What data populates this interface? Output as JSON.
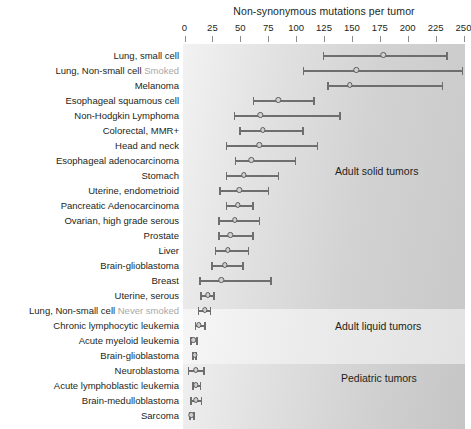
{
  "chart_data": {
    "type": "bar",
    "title": "Non-synonymous mutations per tumor",
    "xlabel": "Non-synonymous mutations per tumor",
    "ylabel": "",
    "xlim": [
      0,
      250
    ],
    "xticks": [
      0,
      25,
      50,
      75,
      100,
      125,
      150,
      175,
      200,
      225,
      250
    ],
    "xticklabels": [
      "0",
      "25",
      "50",
      "75",
      "100",
      "125",
      "150",
      "175",
      "200",
      "225",
      "250"
    ],
    "grid": false,
    "legend": false,
    "orientation": "horizontal",
    "groups": [
      {
        "name": "Adult solid tumors",
        "label": "Adult solid tumors"
      },
      {
        "name": "Adult liquid tumors",
        "label": "Adult liquid tumors"
      },
      {
        "name": "Pediatric tumors",
        "label": "Pediatric tumors"
      }
    ],
    "categories": [
      "Lung, small cell",
      "Lung, Non-small cell Smoked",
      "Melanoma",
      "Esophageal squamous cell",
      "Non-Hodgkin Lymphoma",
      "Colorectal, MMR+",
      "Head and neck",
      "Esophageal adenocarcinoma",
      "Stomach",
      "Uterine, endometrioid",
      "Pancreatic Adenocarcinoma",
      "Ovarian, high grade serous",
      "Prostate",
      "Liver",
      "Brain-glioblastoma",
      "Breast",
      "Uterine, serous",
      "Lung, Non-small cell Never smoked",
      "Chronic lymphocytic leukemia",
      "Acute myeloid leukemia",
      "Brain-glioblastoma",
      "Neuroblastoma",
      "Acute lymphoblastic leukemia",
      "Brain-medulloblastoma",
      "Sarcoma"
    ],
    "rows": [
      {
        "label_main": "Lung, small cell",
        "label_sub": "",
        "group": "Adult solid tumors",
        "low": 124,
        "median": 178,
        "high": 236
      },
      {
        "label_main": "Lung, Non-small cell",
        "label_sub": "Smoked",
        "group": "Adult solid tumors",
        "low": 106,
        "median": 154,
        "high": 250
      },
      {
        "label_main": "Melanoma",
        "label_sub": "",
        "group": "Adult solid tumors",
        "low": 128,
        "median": 148,
        "high": 232
      },
      {
        "label_main": "Esophageal squamous cell",
        "label_sub": "",
        "group": "Adult solid tumors",
        "low": 61,
        "median": 84,
        "high": 117
      },
      {
        "label_main": "Non-Hodgkin Lymphoma",
        "label_sub": "",
        "group": "Adult solid tumors",
        "low": 44,
        "median": 68,
        "high": 140
      },
      {
        "label_main": "Colorectal, MMR+",
        "label_sub": "",
        "group": "Adult solid tumors",
        "low": 49,
        "median": 70,
        "high": 107
      },
      {
        "label_main": "Head and neck",
        "label_sub": "",
        "group": "Adult solid tumors",
        "low": 37,
        "median": 67,
        "high": 120
      },
      {
        "label_main": "Esophageal adenocarcinoma",
        "label_sub": "",
        "group": "Adult solid tumors",
        "low": 45,
        "median": 60,
        "high": 100
      },
      {
        "label_main": "Stomach",
        "label_sub": "",
        "group": "Adult solid tumors",
        "low": 37,
        "median": 53,
        "high": 85
      },
      {
        "label_main": "Uterine, endometrioid",
        "label_sub": "",
        "group": "Adult solid tumors",
        "low": 31,
        "median": 49,
        "high": 76
      },
      {
        "label_main": "Pancreatic Adenocarcinoma",
        "label_sub": "",
        "group": "Adult solid tumors",
        "low": 37,
        "median": 48,
        "high": 62
      },
      {
        "label_main": "Ovarian, high grade serous",
        "label_sub": "",
        "group": "Adult solid tumors",
        "low": 30,
        "median": 45,
        "high": 68
      },
      {
        "label_main": "Prostate",
        "label_sub": "",
        "group": "Adult solid tumors",
        "low": 30,
        "median": 41,
        "high": 62
      },
      {
        "label_main": "Liver",
        "label_sub": "",
        "group": "Adult solid tumors",
        "low": 27,
        "median": 39,
        "high": 58
      },
      {
        "label_main": "Brain-glioblastoma",
        "label_sub": "",
        "group": "Adult solid tumors",
        "low": 24,
        "median": 36,
        "high": 53
      },
      {
        "label_main": "Breast",
        "label_sub": "",
        "group": "Adult solid tumors",
        "low": 13,
        "median": 33,
        "high": 78
      },
      {
        "label_main": "Uterine, serous",
        "label_sub": "",
        "group": "Adult solid tumors",
        "low": 14,
        "median": 21,
        "high": 27
      },
      {
        "label_main": "Lung, Non-small cell",
        "label_sub": "Never smoked",
        "group": "Adult liquid tumors",
        "low": 12,
        "median": 18,
        "high": 24
      },
      {
        "label_main": "Chronic lymphocytic leukemia",
        "label_sub": "",
        "group": "Adult liquid tumors",
        "low": 9,
        "median": 13,
        "high": 19
      },
      {
        "label_main": "Acute myeloid leukemia",
        "label_sub": "",
        "group": "Adult liquid tumors",
        "low": 5,
        "median": 8,
        "high": 12
      },
      {
        "label_main": "Brain-glioblastoma",
        "label_sub": "",
        "group": "Pediatric tumors",
        "low": 7,
        "median": 9,
        "high": 11
      },
      {
        "label_main": "Neuroblastoma",
        "label_sub": "",
        "group": "Pediatric tumors",
        "low": 3,
        "median": 10,
        "high": 18
      },
      {
        "label_main": "Acute lymphoblastic leukemia",
        "label_sub": "",
        "group": "Pediatric tumors",
        "low": 7,
        "median": 10,
        "high": 15
      },
      {
        "label_main": "Brain-medulloblastoma",
        "label_sub": "",
        "group": "Pediatric tumors",
        "low": 5,
        "median": 10,
        "high": 16
      },
      {
        "label_main": "Sarcoma",
        "label_sub": "",
        "group": "Pediatric tumors",
        "low": 4,
        "median": 6,
        "high": 9
      }
    ]
  },
  "colors": {
    "bar": "#6e6e6e",
    "median_fill": "#cfcfcf",
    "median_edge": "#5c5c5c",
    "text": "#231f20",
    "sub_text": "#a8a8a8",
    "band_solid": "#d2d2d2",
    "band_liquid": "#ececec",
    "band_pediatric": "#cfcfcf"
  }
}
